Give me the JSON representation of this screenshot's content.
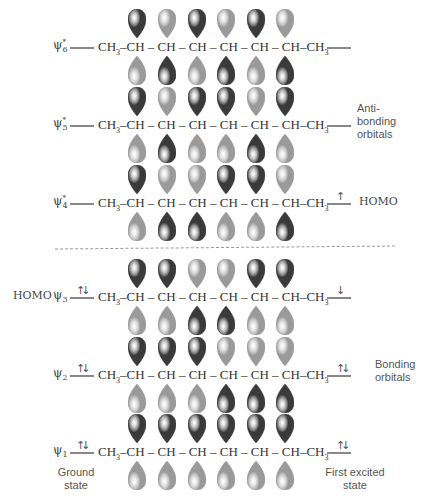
{
  "diagram": {
    "chain": {
      "left_group": "CH3",
      "carbons": [
        "CH",
        "CH",
        "CH",
        "CH",
        "CH",
        "CH"
      ],
      "right_group": "CH3",
      "text": "CH3-CH-CH-CH-CH-CH-CH-CH3"
    },
    "colors": {
      "dark_lobe": "#3a3a3a",
      "light_lobe": "#9a9a9a",
      "level_line": "#888888",
      "dashed_divider": "#999999"
    },
    "orbitals": [
      {
        "id": "psi6",
        "label": "ψ",
        "sub": "6",
        "sup": "*",
        "top_phases": [
          "D",
          "L",
          "D",
          "L",
          "D",
          "L"
        ],
        "ground_electrons": "",
        "excited_electrons": "",
        "y": 47
      },
      {
        "id": "psi5",
        "label": "ψ",
        "sub": "5",
        "sup": "*",
        "top_phases": [
          "D",
          "L",
          "D",
          "D",
          "L",
          "D"
        ],
        "ground_electrons": "",
        "excited_electrons": "",
        "y": 125
      },
      {
        "id": "psi4",
        "label": "ψ",
        "sub": "4",
        "sup": "*",
        "top_phases": [
          "D",
          "L",
          "L",
          "D",
          "D",
          "L"
        ],
        "ground_electrons": "",
        "excited_electrons": "↑",
        "excited_tag": "HOMO",
        "y": 203
      },
      {
        "id": "psi3",
        "label": "ψ",
        "sub": "3",
        "sup": "",
        "top_phases": [
          "D",
          "D",
          "L",
          "L",
          "D",
          "D"
        ],
        "ground_electrons": "↑↓",
        "ground_tag": "HOMO",
        "excited_electrons": "↓",
        "y": 297
      },
      {
        "id": "psi2",
        "label": "ψ",
        "sub": "2",
        "sup": "",
        "top_phases": [
          "D",
          "D",
          "D",
          "L",
          "L",
          "L"
        ],
        "ground_electrons": "↑↓",
        "excited_electrons": "↑↓",
        "y": 375
      },
      {
        "id": "psi1",
        "label": "ψ",
        "sub": "1",
        "sup": "",
        "top_phases": [
          "D",
          "D",
          "D",
          "D",
          "D",
          "D"
        ],
        "ground_electrons": "↑↓",
        "excited_electrons": "↑↓",
        "y": 452
      }
    ],
    "labels": {
      "antibonding": [
        "Anti-",
        "bonding",
        "orbitals"
      ],
      "bonding": [
        "Bonding",
        "orbitals"
      ],
      "ground_state": [
        "Ground",
        "state"
      ],
      "first_excited_state": [
        "First excited",
        "state"
      ],
      "homo": "HOMO"
    }
  }
}
